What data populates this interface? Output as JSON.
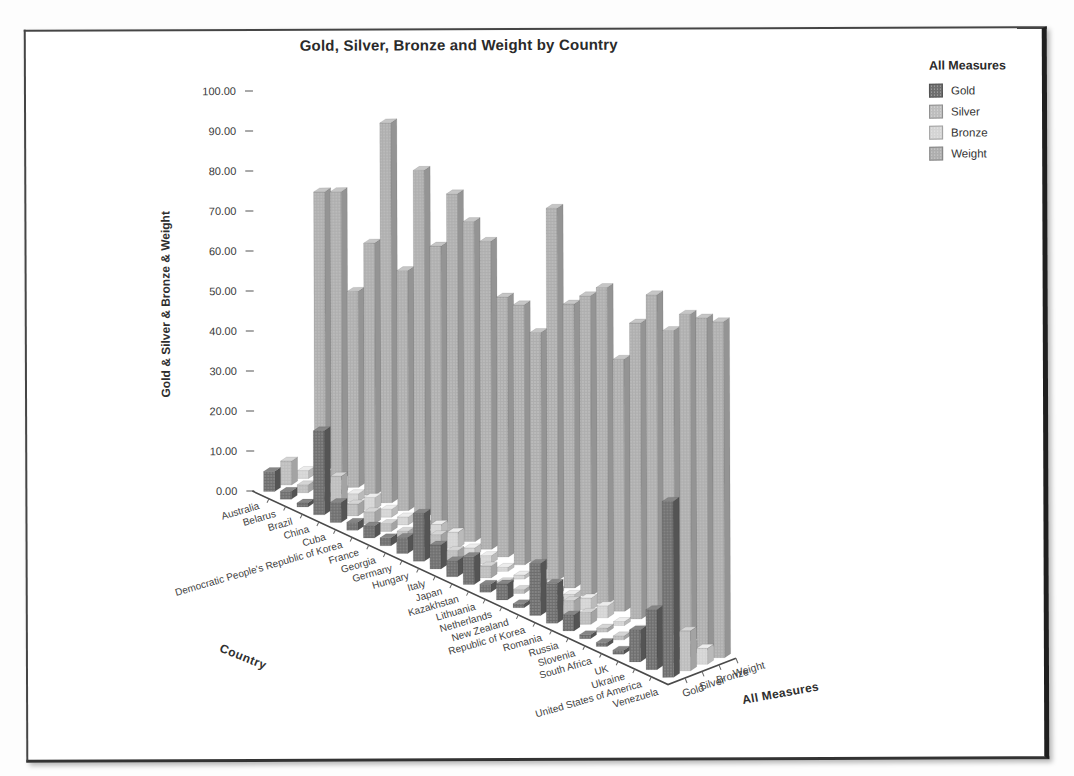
{
  "chart": {
    "title": "Gold, Silver, Bronze and Weight by Country",
    "y_axis_label": "Gold & Silver & Bronze & Weight",
    "x_axis_title": "Country",
    "z_axis_title": "All Measures",
    "legend_title": "All Measures"
  },
  "chart_data": {
    "type": "bar",
    "subtype": "3d-bar",
    "title": "Gold, Silver, Bronze and Weight by Country",
    "xlabel": "Country",
    "zlabel": "All Measures",
    "ylabel": "Gold & Silver & Bronze & Weight",
    "ylim": [
      0,
      100
    ],
    "ytick_step": 10,
    "ytick_labels": [
      "0.00",
      "10.00",
      "20.00",
      "30.00",
      "40.00",
      "50.00",
      "60.00",
      "70.00",
      "80.00",
      "90.00",
      "100.00"
    ],
    "grid": false,
    "legend_position": "top-right",
    "categories": [
      "Australia",
      "Belarus",
      "Brazil",
      "China",
      "Cuba",
      "Democratic People's Republic of Korea",
      "France",
      "Georgia",
      "Germany",
      "Hungary",
      "Italy",
      "Japan",
      "Kazakhstan",
      "Lithuania",
      "Netherlands",
      "New Zealand",
      "Republic of Korea",
      "Romania",
      "Russia",
      "Slovenia",
      "South Africa",
      "UK",
      "Ukraine",
      "United States of America",
      "Venezuela"
    ],
    "series": [
      {
        "name": "Gold",
        "color": "#6e6e6e",
        "values": [
          5,
          2,
          1,
          21,
          5,
          2,
          3,
          2,
          4,
          12,
          6,
          4,
          7,
          2,
          4,
          1,
          13,
          10,
          4,
          1,
          1,
          1,
          8,
          15,
          44
        ]
      },
      {
        "name": "Silver",
        "color": "#bdbdbd",
        "values": [
          6,
          2,
          1,
          8,
          3,
          3,
          2,
          2,
          3,
          5,
          3,
          2,
          3,
          1,
          1,
          1,
          2,
          4,
          3,
          1,
          1,
          1,
          2,
          3,
          10
        ]
      },
      {
        "name": "Bronze",
        "color": "#d4d4d4",
        "values": [
          2,
          3,
          1,
          2,
          3,
          2,
          2,
          2,
          4,
          4,
          2,
          2,
          1,
          1,
          1,
          1,
          2,
          3,
          3,
          1,
          1,
          2,
          2,
          3,
          4
        ]
      },
      {
        "name": "Weight",
        "color": "#aeaeae",
        "values": [
          70,
          72,
          49,
          63,
          95,
          60,
          87,
          70,
          85,
          80,
          77,
          65,
          65,
          60,
          93,
          71,
          75,
          79,
          63,
          74,
          83,
          76,
          82,
          83,
          84
        ]
      }
    ]
  }
}
